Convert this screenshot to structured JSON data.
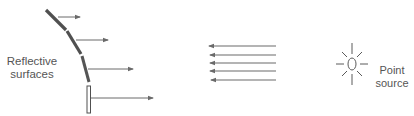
{
  "labels": {
    "reflective_surfaces": [
      "Reflective",
      "surfaces"
    ],
    "point_source": [
      "Point",
      "source"
    ]
  },
  "colors": {
    "surface_dark": "#505050",
    "surface_light": "#ffffff",
    "arrow": "#6a6a6a",
    "text": "#555555"
  },
  "elements": {
    "reflective_segments": 4,
    "reflected_rays": 4,
    "parallel_rays": 5,
    "icon": "light-bulb-icon"
  }
}
